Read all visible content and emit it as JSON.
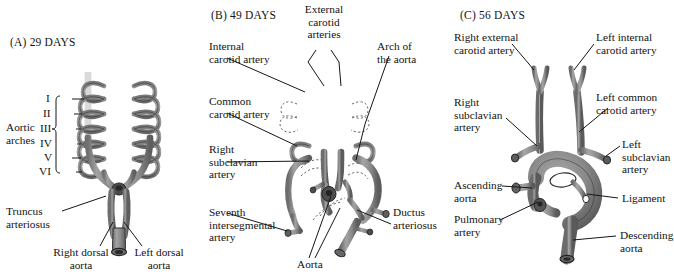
{
  "figure": {
    "background_color": "#ffffff",
    "vessel_fill": "#8d8d8d",
    "vessel_stroke": "#2b2b2b",
    "leader_color": "#1a1a1a",
    "text_color": "#131313"
  },
  "panels": [
    {
      "id": "A",
      "title": "(A)  29 DAYS",
      "stage_label": "29 DAYS",
      "labels": {
        "aortic_arches": "Aortic\narches",
        "roman_numerals": [
          "I",
          "II",
          "III",
          "IV",
          "V",
          "VI"
        ],
        "truncus_arteriosus": "Truncus\narteriosus",
        "right_dorsal_aorta": "Right dorsal\naorta",
        "left_dorsal_aorta": "Left dorsal\naorta"
      }
    },
    {
      "id": "B",
      "title": "(B)  49 DAYS",
      "stage_label": "49 DAYS",
      "labels": {
        "internal_carotid_artery": "Internal\ncarotid artery",
        "external_carotid_arteries": "External\ncarotid\narteries",
        "arch_of_the_aorta": "Arch of\nthe aorta",
        "common_carotid_artery": "Common\ncarotid artery",
        "right_subclavian_artery": "Right\nsubclavian\nartery",
        "seventh_intersegmental_artery": "Seventh\nintersegmental\nartery",
        "aorta": "Aorta",
        "ductus_arteriosus": "Ductus\narteriosus"
      }
    },
    {
      "id": "C",
      "title": "(C)  56 DAYS",
      "stage_label": "56 DAYS",
      "labels": {
        "right_external_carotid_artery": "Right external\ncarotid artery",
        "left_internal_carotid_artery": "Left internal\ncarotid artery",
        "right_subclavian_artery": "Right\nsubclavian\nartery",
        "left_common_carotid_artery": "Left common\ncarotid artery",
        "left_subclavian_artery": "Left\nsubclavian\nartery",
        "ascending_aorta": "Ascending\naorta",
        "ligament": "Ligament",
        "pulmonary_artery": "Pulmonary\nartery",
        "descending_aorta": "Descending\naorta"
      }
    }
  ]
}
